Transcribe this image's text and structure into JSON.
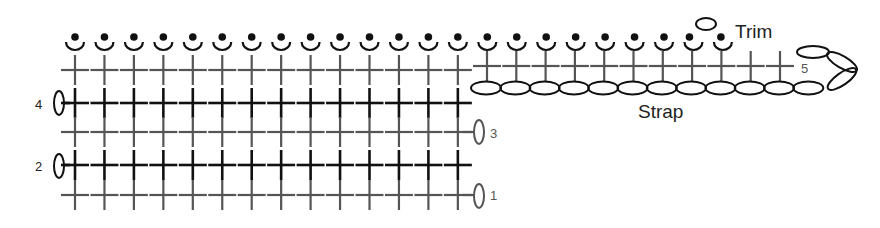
{
  "diagram": {
    "type": "crochet-stitch-chart",
    "labels": {
      "trim": "Trim",
      "strap": "Strap",
      "row1": "1",
      "row2": "2",
      "row3": "3",
      "row4": "4",
      "row5": "5"
    },
    "colors": {
      "gray_row": "#555555",
      "black_row": "#111111",
      "label_gray": "#555555",
      "label_black": "#222222"
    },
    "legend_symbols": {
      "cross": "single-crochet",
      "oval": "chain-stitch",
      "dot-over-arc": "slip-stitch-in-back-loop"
    },
    "body_columns": 14,
    "strap_crosses": 11,
    "strap_chains": 12,
    "trim_columns": 23
  }
}
